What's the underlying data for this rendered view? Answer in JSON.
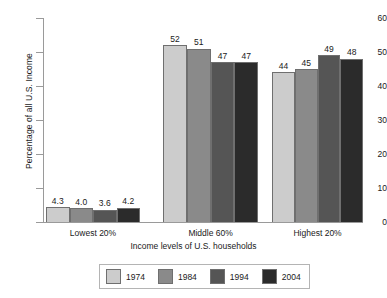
{
  "chart_data": {
    "type": "bar",
    "title": "",
    "subtitle": "",
    "xlabel": "Income levels of U.S. households",
    "ylabel": "Percentage of all U.S. Income",
    "categories": [
      "Lowest 20%",
      "Middle 60%",
      "Highest 20%"
    ],
    "ylim": [
      0,
      60
    ],
    "yticks": [
      0,
      10,
      20,
      30,
      40,
      50,
      60
    ],
    "ytick_labels": [
      "0",
      "10",
      "20",
      "30",
      "40",
      "50",
      "60"
    ],
    "grid": false,
    "legend_position": "bottom",
    "series": [
      {
        "name": "1974",
        "color": "#cccccc",
        "values": [
          4.3,
          52,
          44
        ],
        "labels": [
          "4.3",
          "52",
          "44"
        ]
      },
      {
        "name": "1984",
        "color": "#8a8a8a",
        "values": [
          4.0,
          51,
          45
        ],
        "labels": [
          "4.0",
          "51",
          "45"
        ]
      },
      {
        "name": "1994",
        "color": "#555555",
        "values": [
          3.6,
          47,
          49
        ],
        "labels": [
          "3.6",
          "47",
          "49"
        ]
      },
      {
        "name": "2004",
        "color": "#2b2b2b",
        "values": [
          4.2,
          47,
          48
        ],
        "labels": [
          "4.2",
          "47",
          "48"
        ]
      }
    ]
  },
  "axis": {
    "y_label": "Percentage of all U.S. Income",
    "x_label": "Income levels of U.S. households",
    "y_ticks": [
      "60",
      "50",
      "40",
      "30",
      "20",
      "10",
      "0"
    ]
  },
  "legend": {
    "entries": [
      {
        "label": "1974",
        "color": "#cccccc"
      },
      {
        "label": "1984",
        "color": "#8a8a8a"
      },
      {
        "label": "1994",
        "color": "#555555"
      },
      {
        "label": "2004",
        "color": "#2b2b2b"
      }
    ]
  },
  "categories": [
    {
      "label": "Lowest 20%"
    },
    {
      "label": "Middle 60%"
    },
    {
      "label": "Highest 20%"
    }
  ]
}
